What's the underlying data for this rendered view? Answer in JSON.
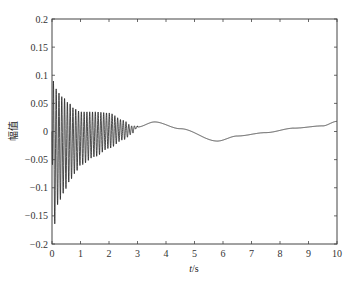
{
  "chart_data": {
    "type": "line",
    "title": "",
    "xlabel": "t/s",
    "xlabel_italic_part": "t",
    "xlabel_unit_part": "/s",
    "ylabel": "幅值",
    "xlim": [
      0,
      10
    ],
    "ylim": [
      -0.2,
      0.2
    ],
    "grid": false,
    "legend": null,
    "x_ticks": [
      0,
      1,
      2,
      3,
      4,
      5,
      6,
      7,
      8,
      9,
      10
    ],
    "x_tick_labels": [
      "0",
      "1",
      "2",
      "3",
      "4",
      "5",
      "6",
      "7",
      "8",
      "9",
      "10"
    ],
    "y_ticks": [
      0.2,
      0.15,
      0.1,
      0.05,
      0,
      -0.05,
      -0.1,
      -0.15,
      -0.2
    ],
    "y_tick_labels": [
      "0.2",
      "0.15",
      "0.1",
      "0.05",
      "0",
      "-0.05",
      "-0.1",
      "-0.15",
      "-0.2"
    ],
    "series": [
      {
        "name": "amplitude",
        "color": "#222222",
        "description": "Damped high-frequency oscillation (approx 10 Hz) decaying to ~0 by t≈3 s, superimposed on a slow low-frequency drift",
        "oscillation_envelope": {
          "t": [
            0.05,
            0.2,
            0.4,
            0.6,
            0.8,
            1.0,
            1.5,
            2.0,
            2.5,
            2.8,
            3.0
          ],
          "upper": [
            0.09,
            0.07,
            0.06,
            0.05,
            0.04,
            0.035,
            0.035,
            0.033,
            0.02,
            0.01,
            0.002
          ],
          "lower": [
            -0.175,
            -0.13,
            -0.11,
            -0.09,
            -0.075,
            -0.06,
            -0.045,
            -0.03,
            -0.015,
            -0.005,
            0.0
          ]
        },
        "slow_component": {
          "t": [
            0,
            1,
            2,
            3,
            3.6,
            4.5,
            5.8,
            6.5,
            7.5,
            8.5,
            9.5,
            10
          ],
          "y": [
            0.0,
            0.0,
            0.002,
            0.008,
            0.017,
            0.005,
            -0.017,
            -0.008,
            -0.002,
            0.006,
            0.01,
            0.018
          ]
        }
      }
    ]
  }
}
